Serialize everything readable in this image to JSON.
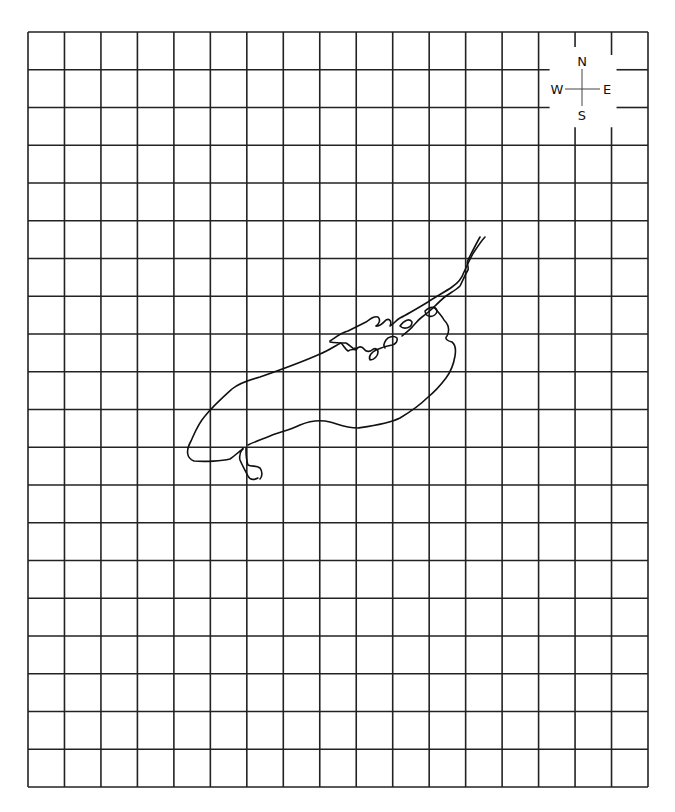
{
  "map": {
    "grid": {
      "columns": 17,
      "rows": 20,
      "left": 28,
      "top": 32,
      "right": 648,
      "bottom": 787,
      "line_color": "#222222"
    },
    "compass": {
      "north": "N",
      "south": "S",
      "east": "E",
      "west": "W"
    },
    "feature": {
      "type": "lake outline with outflow and inflow rivers",
      "stroke_color": "#111111"
    }
  }
}
